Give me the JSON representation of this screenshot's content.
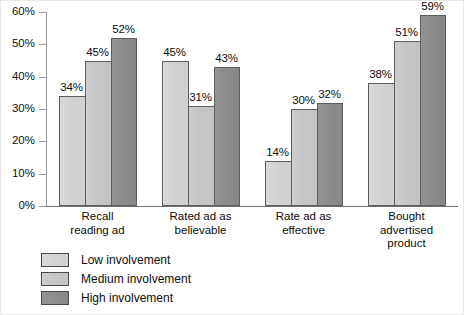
{
  "chart_data": {
    "type": "bar",
    "title": "",
    "subtitle": "",
    "xlabel": "",
    "ylabel": "",
    "ylim": [
      0,
      60
    ],
    "ytick_labels": [
      "0%",
      "10%",
      "20%",
      "30%",
      "40%",
      "50%",
      "60%"
    ],
    "ytick_values": [
      0,
      10,
      20,
      30,
      40,
      50,
      60
    ],
    "grid": false,
    "legend_position": "bottom-left",
    "value_suffix": "%",
    "categories": [
      "Recall\nreading ad",
      "Rated ad as\nbelievable",
      "Rate ad as\neffective",
      "Bought\nadvertised\nproduct"
    ],
    "category_lines": [
      [
        "Recall",
        "reading ad"
      ],
      [
        "Rated ad as",
        "believable"
      ],
      [
        "Rate ad as",
        "effective"
      ],
      [
        "Bought",
        "advertised",
        "product"
      ]
    ],
    "series": [
      {
        "name": "Low involvement",
        "color": "#d4d4d4",
        "values": [
          34,
          45,
          14,
          38
        ],
        "labels": [
          "34%",
          "45%",
          "14%",
          "38%"
        ]
      },
      {
        "name": "Medium involvement",
        "color": "#c6c6c6",
        "values": [
          45,
          31,
          30,
          51
        ],
        "labels": [
          "45%",
          "31%",
          "30%",
          "51%"
        ]
      },
      {
        "name": "High involvement",
        "color": "#8b8b8b",
        "values": [
          52,
          43,
          32,
          59
        ],
        "labels": [
          "52%",
          "43%",
          "32%",
          "59%"
        ]
      }
    ]
  },
  "legend": {
    "items": [
      {
        "label": "Low involvement",
        "swatch": "low"
      },
      {
        "label": "Medium involvement",
        "swatch": "medium"
      },
      {
        "label": "High involvement",
        "swatch": "high"
      }
    ]
  },
  "axis": {
    "y_ticks": [
      {
        "label": "60%",
        "value": 60
      },
      {
        "label": "50%",
        "value": 50
      },
      {
        "label": "40%",
        "value": 40
      },
      {
        "label": "30%",
        "value": 30
      },
      {
        "label": "20%",
        "value": 20
      },
      {
        "label": "10%",
        "value": 10
      },
      {
        "label": "0%",
        "value": 0
      }
    ]
  }
}
